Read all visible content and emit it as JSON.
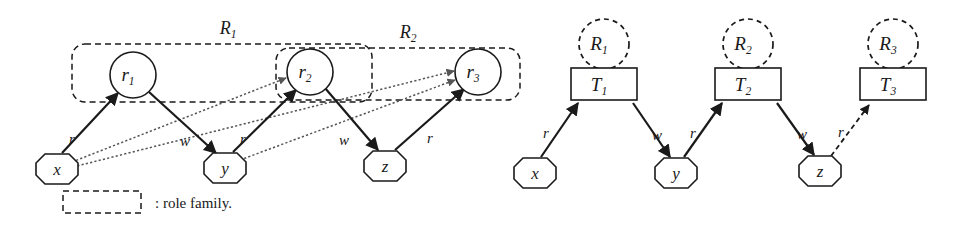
{
  "figure": {
    "caption_legend": ": role family.",
    "colors": {
      "ink": "#1a1a1a",
      "dotted_edge": "#555555",
      "background": "#ffffff"
    }
  },
  "left_diagram": {
    "role_nodes": [
      {
        "id": "r1",
        "base": "r",
        "sub": "1",
        "cx": 133,
        "cy": 75,
        "r": 23
      },
      {
        "id": "r2",
        "base": "r",
        "sub": "2",
        "cx": 310,
        "cy": 72,
        "r": 23
      },
      {
        "id": "r3",
        "base": "r",
        "sub": "3",
        "cx": 478,
        "cy": 72,
        "r": 23
      }
    ],
    "object_nodes": [
      {
        "id": "x",
        "label": "x",
        "cx": 57,
        "cy": 166
      },
      {
        "id": "y",
        "label": "y",
        "cx": 225,
        "cy": 165
      },
      {
        "id": "z",
        "label": "z",
        "cx": 385,
        "cy": 163
      }
    ],
    "families": [
      {
        "id": "R1",
        "base": "R",
        "sub": "1",
        "label_x": 228,
        "label_y": 27,
        "x": 72,
        "y": 44,
        "w": 300,
        "h": 58
      },
      {
        "id": "R2",
        "base": "R",
        "sub": "2",
        "label_x": 408,
        "label_y": 32,
        "x": 276,
        "y": 48,
        "w": 244,
        "h": 52
      }
    ],
    "solid_edges": [
      {
        "from": "x",
        "to": "r1",
        "label": "r",
        "lx": 72,
        "ly": 144
      },
      {
        "from": "r1",
        "to": "y",
        "label": "w",
        "lx": 185,
        "ly": 146
      },
      {
        "from": "y",
        "to": "r2",
        "label": "r",
        "lx": 243,
        "ly": 144
      },
      {
        "from": "r2",
        "to": "z",
        "label": "w",
        "lx": 344,
        "ly": 145
      },
      {
        "from": "z",
        "to": "r3",
        "label": "r",
        "lx": 430,
        "ly": 143
      }
    ],
    "dotted_edges": [
      {
        "from": "x",
        "to": "r2"
      },
      {
        "from": "x",
        "to": "r3"
      },
      {
        "from": "y",
        "to": "r3"
      }
    ]
  },
  "right_diagram": {
    "family_circles": [
      {
        "id": "R1",
        "base": "R",
        "sub": "1",
        "cx": 604,
        "cy": 44,
        "r": 25
      },
      {
        "id": "R2",
        "base": "R",
        "sub": "2",
        "cx": 748,
        "cy": 44,
        "r": 25
      },
      {
        "id": "R3",
        "base": "R",
        "sub": "3",
        "cx": 893,
        "cy": 44,
        "r": 25
      }
    ],
    "type_boxes": [
      {
        "id": "T1",
        "base": "T",
        "sub": "1",
        "x": 571,
        "y": 68,
        "w": 66,
        "h": 32
      },
      {
        "id": "T2",
        "base": "T",
        "sub": "2",
        "x": 715,
        "y": 68,
        "w": 66,
        "h": 32
      },
      {
        "id": "T3",
        "base": "T",
        "sub": "3",
        "x": 860,
        "y": 68,
        "w": 66,
        "h": 32
      }
    ],
    "object_nodes": [
      {
        "id": "x",
        "label": "x",
        "cx": 535,
        "cy": 170
      },
      {
        "id": "y",
        "label": "y",
        "cx": 676,
        "cy": 170
      },
      {
        "id": "z",
        "label": "z",
        "cx": 820,
        "cy": 168
      }
    ],
    "solid_edges": [
      {
        "from": "x",
        "to": "T1",
        "label": "r",
        "lx": 546,
        "ly": 136
      },
      {
        "from": "T1",
        "to": "y",
        "label": "w",
        "lx": 657,
        "ly": 138
      },
      {
        "from": "y",
        "to": "T2",
        "label": "r",
        "lx": 693,
        "ly": 136
      },
      {
        "from": "T2",
        "to": "z",
        "label": "w",
        "lx": 802,
        "ly": 137
      },
      {
        "from": "z",
        "to": "T3",
        "label": "r",
        "lx": 841,
        "ly": 135,
        "style": "dashed"
      }
    ]
  }
}
